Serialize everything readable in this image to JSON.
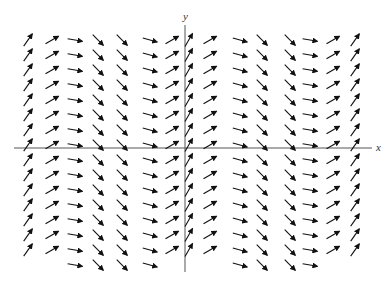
{
  "figure": {
    "kind": "slope-field",
    "axis_labels": {
      "x": "x",
      "y": "y"
    },
    "colors": {
      "arrow": "#111111",
      "axis": "#555555",
      "background": "#ffffff"
    }
  },
  "chart_data": {
    "type": "scatter",
    "title": "",
    "xlabel": "x",
    "ylabel": "y",
    "grid": false,
    "legend": "none",
    "xlim": [
      -7.6,
      8.2
    ],
    "ylim": [
      -8.2,
      8.0
    ],
    "columns_x": [
      -7,
      -6,
      -5,
      -4,
      -3,
      -2,
      -1,
      0,
      1,
      2,
      3,
      4,
      5,
      6,
      7
    ],
    "column_slopes": [
      1.43,
      0.58,
      -0.18,
      -1.0,
      -1.0,
      -0.27,
      0.58,
      1.73,
      0.58,
      -0.27,
      -1.0,
      -1.0,
      -0.18,
      0.58,
      1.43
    ],
    "rows_y_upper": [
      7,
      6,
      5,
      4,
      3,
      2,
      1,
      0
    ],
    "rows_y_lower": [
      -1,
      -2,
      -3,
      -4,
      -5,
      -6,
      -7
    ],
    "extra_bottom_row_y": -8,
    "extra_bottom_row_columns": [
      -5,
      -4,
      -3,
      -2,
      2,
      3,
      4,
      5
    ]
  }
}
